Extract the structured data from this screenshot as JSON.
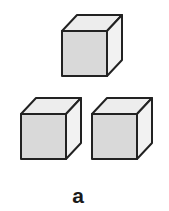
{
  "figure": {
    "label": "a",
    "colors": {
      "front_face": "#d9d9d9",
      "top_face": "#ededed",
      "side_face": "#f2f2f2",
      "edge": "#222222"
    },
    "cubes": [
      {
        "name": "top-cube",
        "x": 62,
        "y": 31,
        "size": 45,
        "dx": 15,
        "dy": 16
      },
      {
        "name": "bottom-left-cube",
        "x": 21,
        "y": 114,
        "size": 45,
        "dx": 15,
        "dy": 16
      },
      {
        "name": "bottom-right-cube",
        "x": 92,
        "y": 114,
        "size": 45,
        "dx": 15,
        "dy": 16
      }
    ]
  }
}
